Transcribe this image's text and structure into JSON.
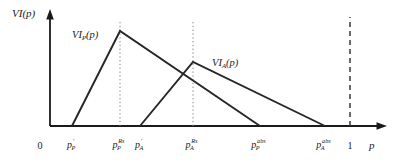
{
  "figure": {
    "background_color": "#ffffff",
    "line_color": "#262626",
    "axis_color": "#1a1a1a",
    "guide_color": "#7d7d7d"
  },
  "axes": {
    "y_axis_label": "VI(p)",
    "x_axis_label": "p",
    "origin_label": "0",
    "unit_label": "1"
  },
  "curves": {
    "principal": {
      "label_main": "VI",
      "label_sub": "P",
      "label_tail": "(p)"
    },
    "agent": {
      "label_main": "VI",
      "label_sub": "A",
      "label_tail": "(p)"
    }
  },
  "ticks": [
    {
      "base": "p",
      "sub": "P",
      "sup": "'",
      "x": 72
    },
    {
      "base": "p",
      "sub": "P",
      "sup": "Rs",
      "x": 120
    },
    {
      "base": "p",
      "sub": "A",
      "sup": "'",
      "x": 140
    },
    {
      "base": "p",
      "sub": "A",
      "sup": "Rs",
      "x": 193
    },
    {
      "base": "p",
      "sub": "P",
      "sup": "abs",
      "x": 260
    },
    {
      "base": "p",
      "sub": "A",
      "sup": "abs",
      "x": 325
    }
  ],
  "chart_data": {
    "type": "line",
    "title": "",
    "xlabel": "p",
    "ylabel": "VI(p)",
    "xlim": [
      0,
      1.12
    ],
    "ylim": [
      0,
      1.0
    ],
    "grid": false,
    "legend": "inline-annotations",
    "categories": [
      "p_P'",
      "p_P^Rs",
      "p_A'",
      "p_A^Rs",
      "p_P^abs",
      "p_A^abs",
      "1"
    ],
    "series": [
      {
        "name": "VI_P(p)",
        "comment": "Principal value-of-information: zero until p_P', linear rise to peak at p_P^Rs, linear fall to zero at p_P^abs",
        "points": [
          {
            "x_px": 72,
            "y_px": 126,
            "x_label": "p_P'",
            "value": 0.0
          },
          {
            "x_px": 120,
            "y_px": 31,
            "x_label": "p_P^Rs",
            "value": 1.0
          },
          {
            "x_px": 260,
            "y_px": 126,
            "x_label": "p_P^abs",
            "value": 0.0
          }
        ]
      },
      {
        "name": "VI_A(p)",
        "comment": "Agent value-of-information: zero until p_A', linear rise to a lower peak at p_A^Rs, linear fall to zero at p_A^abs",
        "points": [
          {
            "x_px": 140,
            "y_px": 126,
            "x_label": "p_A'",
            "value": 0.0
          },
          {
            "x_px": 193,
            "y_px": 62,
            "x_label": "p_A^Rs",
            "value": 0.672
          },
          {
            "x_px": 325,
            "y_px": 126,
            "x_label": "p_A^abs",
            "value": 0.0
          }
        ]
      }
    ],
    "guides": [
      {
        "name": "p_P^Rs guide",
        "x_px": 120,
        "style": "dotted"
      },
      {
        "name": "p_A^Rs guide",
        "x_px": 193,
        "style": "dotted"
      },
      {
        "name": "p equals 1 guide",
        "x_px": 350,
        "style": "dashed"
      }
    ]
  }
}
